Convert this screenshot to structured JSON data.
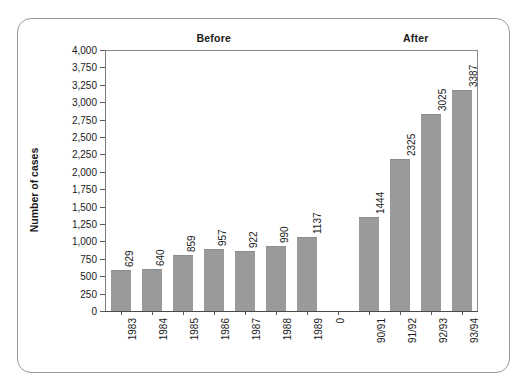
{
  "chart_data": {
    "type": "bar",
    "title": "",
    "subtitle": "",
    "xlabel": "",
    "ylabel": "Number of cases",
    "ylim": [
      0,
      4000
    ],
    "grid": false,
    "legend": "none",
    "y_ticks": [
      "0",
      "250",
      "500",
      "750",
      "1,000",
      "1,250",
      "1,500",
      "1,750",
      "2,000",
      "2,250",
      "2,500",
      "2,750",
      "3,000",
      "3,250",
      "3,750",
      "4,000"
    ],
    "y_tick_values": [
      0,
      250,
      500,
      750,
      1000,
      1250,
      1500,
      1750,
      2000,
      2250,
      2500,
      2750,
      3000,
      3250,
      3750,
      4000
    ],
    "categories": [
      "1983",
      "1984",
      "1985",
      "1986",
      "1987",
      "1988",
      "1989",
      "0",
      "90/91",
      "91/92",
      "92/93",
      "93/94"
    ],
    "values": [
      629,
      640,
      859,
      957,
      922,
      990,
      1137,
      null,
      1444,
      2325,
      3025,
      3387
    ],
    "value_labels": [
      "629",
      "640",
      "859",
      "957",
      "922",
      "990",
      "1137",
      "",
      "1444",
      "2325",
      "3025",
      "3387"
    ],
    "groups": [
      {
        "label": "Before",
        "categories": [
          "1983",
          "1984",
          "1985",
          "1986",
          "1987",
          "1988",
          "1989"
        ]
      },
      {
        "label": "After",
        "categories": [
          "90/91",
          "91/92",
          "92/93",
          "93/94"
        ]
      }
    ],
    "bar_color": "#9a9a9a",
    "text_color": "#1a1a1a",
    "axis_color": "#5a5a5a",
    "border_color": "#9a9a9a",
    "background": "#ffffff"
  }
}
